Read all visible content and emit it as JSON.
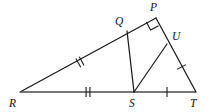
{
  "figure": {
    "width": 211,
    "height": 112,
    "background_color": "#ffffff",
    "stroke_color": "#1a1a1a",
    "baseline_color": "#4a4a4a"
  },
  "vertices": [
    {
      "id": "R",
      "label": "R",
      "x": 20,
      "y": 92,
      "label_x": 13,
      "label_y": 106
    },
    {
      "id": "Q",
      "label": "Q",
      "x": 127,
      "y": 31,
      "label_x": 118,
      "label_y": 25
    },
    {
      "id": "P",
      "label": "P",
      "x": 156,
      "y": 18,
      "label_x": 152,
      "label_y": 11
    },
    {
      "id": "U",
      "label": "U",
      "x": 167,
      "y": 44,
      "label_x": 174,
      "label_y": 41
    },
    {
      "id": "S",
      "label": "S",
      "x": 134,
      "y": 92,
      "label_x": 130,
      "label_y": 106
    },
    {
      "id": "T",
      "label": "T",
      "x": 196,
      "y": 92,
      "label_x": 192,
      "label_y": 106
    }
  ],
  "segments": [
    {
      "id": "RP",
      "from": "R",
      "to": "P",
      "style": "thin",
      "description": "hypotenuse side from R through Q to P"
    },
    {
      "id": "RT",
      "from": "R",
      "to": "T",
      "style": "base",
      "description": "horizontal base from R through S to T"
    },
    {
      "id": "PT",
      "from": "P",
      "to": "T",
      "style": "thin",
      "description": "right side from P through U to T"
    },
    {
      "id": "QS",
      "from": "Q",
      "to": "S",
      "style": "thin",
      "description": "cevian from Q to S"
    },
    {
      "id": "SU",
      "from": "S",
      "to": "U",
      "style": "thin",
      "description": "cevian from S to U"
    }
  ],
  "tick_marks": [
    {
      "id": "tick-RQ",
      "on": "RQ",
      "count": 2,
      "x": 80,
      "y": 62,
      "angle": -29.7,
      "note": "double tick, congruent to RS"
    },
    {
      "id": "tick-RS",
      "on": "RS",
      "count": 2,
      "x": 88,
      "y": 92,
      "angle": 0,
      "note": "double tick, congruent to RQ"
    },
    {
      "id": "tick-ST",
      "on": "ST",
      "count": 1,
      "x": 167,
      "y": 92,
      "angle": 0,
      "note": "single tick, congruent to UT"
    },
    {
      "id": "tick-UT",
      "on": "UT",
      "count": 1,
      "x": 181,
      "y": 68,
      "angle": 67.0,
      "note": "single tick, congruent to ST"
    }
  ],
  "right_angle": {
    "id": "right-angle-P",
    "at_vertex": "P",
    "size": 9,
    "note": "square mark indicating 90 degrees at P"
  }
}
